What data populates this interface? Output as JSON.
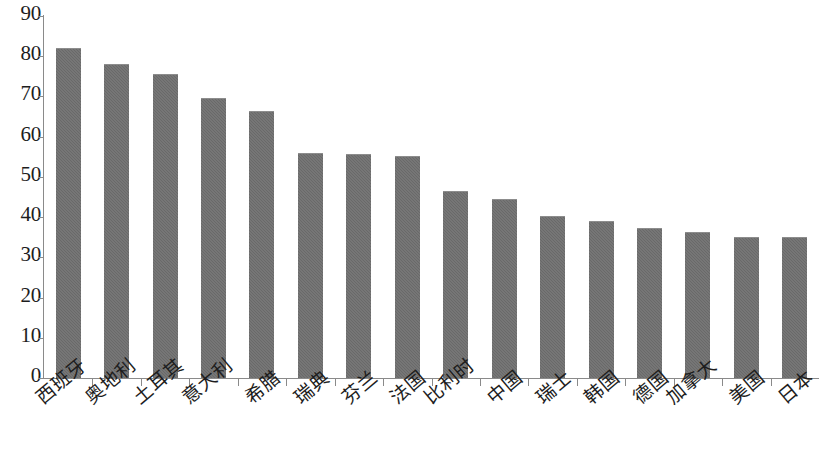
{
  "chart_data": {
    "type": "bar",
    "title": "",
    "subtitle": "",
    "xlabel": "",
    "ylabel": "",
    "ylim": [
      0,
      90
    ],
    "ytick_step": 10,
    "yticks": [
      0,
      10,
      20,
      30,
      40,
      50,
      60,
      70,
      80,
      90
    ],
    "grid": false,
    "legend": "none",
    "bar_color": "#6d6d6d",
    "axis_color": "#8a8a8a",
    "text_color": "#1d1d1d",
    "background_color": "#ffffff",
    "categories": [
      "西班牙",
      "奥地利",
      "土耳其",
      "意大利",
      "希腊",
      "瑞典",
      "芬兰",
      "法国",
      "比利时",
      "中国",
      "瑞士",
      "韩国",
      "德国",
      "加拿大",
      "美国",
      "日本"
    ],
    "values": [
      82,
      78,
      75.5,
      69.5,
      66.5,
      56,
      55.8,
      55.3,
      46.5,
      44.5,
      40.2,
      39,
      37.3,
      36.3,
      35,
      35
    ]
  }
}
